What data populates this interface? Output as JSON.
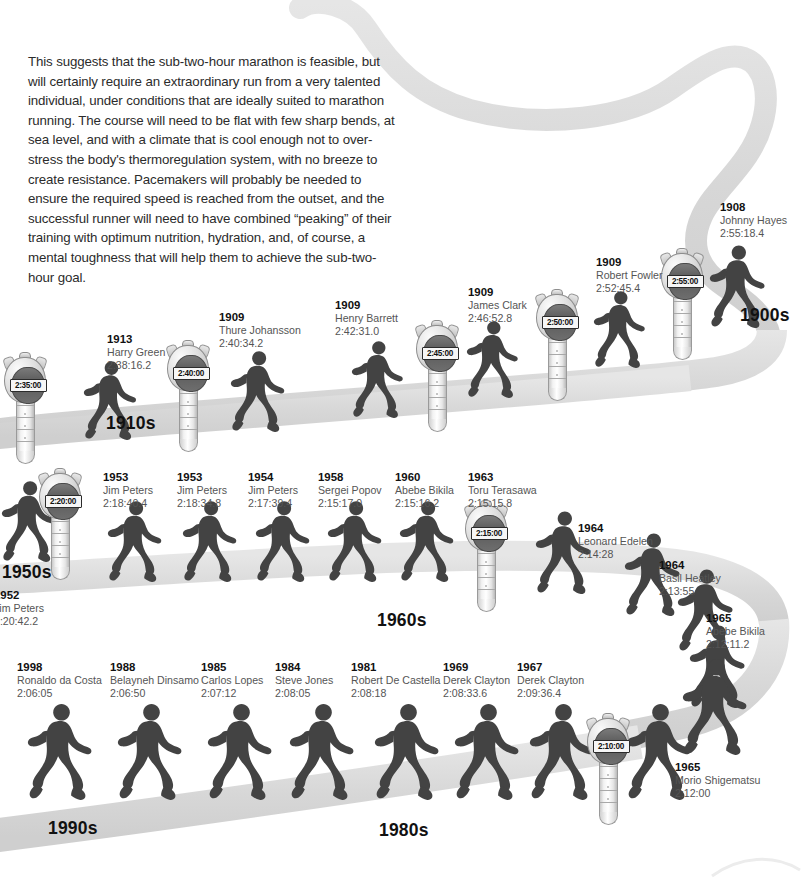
{
  "intro": {
    "paragraph": "This suggests that the sub-two-hour marathon is feasible, but will certainly require an extraordinary run from a very talented individual, under conditions that are ideally suited to marathon running. The course will need to be flat with few sharp bends, at sea level, and with a climate that is cool enough not to over-stress the body's thermoregulation system, with no breeze to create resistance. Pacemakers will probably be needed to ensure the required speed is reached from the outset, and the successful runner will need to have combined “peaking” of their training with optimum nutrition, hydration, and, of course, a mental toughness that will help them to achieve the sub-two-hour goal."
  },
  "colors": {
    "path": "#d8d8d8",
    "runner": "#4d4d4d",
    "label_year": "#111111",
    "label_text": "#555555",
    "lcd_bg": "#f6f6f6",
    "background": "#ffffff"
  },
  "decades": [
    {
      "label": "1900s",
      "x": 740,
      "y": 305
    },
    {
      "label": "1910s",
      "x": 106,
      "y": 413
    },
    {
      "label": "1950s",
      "x": 2,
      "y": 562
    },
    {
      "label": "1960s",
      "x": 377,
      "y": 610
    },
    {
      "label": "1990s",
      "x": 48,
      "y": 818
    },
    {
      "label": "1980s",
      "x": 379,
      "y": 820
    }
  ],
  "records": [
    {
      "year": "1908",
      "name": "Johnny Hayes",
      "time": "2:55:18.4",
      "x": 720,
      "y": 200,
      "align": "left"
    },
    {
      "year": "1909",
      "name": "Robert Fowler",
      "time": "2:52:45.4",
      "x": 596,
      "y": 255,
      "align": "left"
    },
    {
      "year": "1909",
      "name": "James Clark",
      "time": "2:46:52.8",
      "x": 468,
      "y": 285,
      "align": "left"
    },
    {
      "year": "1909",
      "name": "Henry Barrett",
      "time": "2:42:31.0",
      "x": 335,
      "y": 298,
      "align": "left"
    },
    {
      "year": "1909",
      "name": "Thure Johansson",
      "time": "2:40:34.2",
      "x": 219,
      "y": 310,
      "align": "left"
    },
    {
      "year": "1913",
      "name": "Harry Green",
      "time": "2:38:16.2",
      "x": 107,
      "y": 332,
      "align": "left"
    },
    {
      "year": "1952",
      "name": "Jim Peters",
      "time": "2:20:42.2",
      "x": -6,
      "y": 588,
      "align": "left"
    },
    {
      "year": "1953",
      "name": "Jim Peters",
      "time": "2:18:40.4",
      "x": 103,
      "y": 470,
      "align": "left"
    },
    {
      "year": "1953",
      "name": "Jim Peters",
      "time": "2:18:34.8",
      "x": 177,
      "y": 470,
      "align": "left"
    },
    {
      "year": "1954",
      "name": "Jim Peters",
      "time": "2:17:39.4",
      "x": 248,
      "y": 470,
      "align": "left"
    },
    {
      "year": "1958",
      "name": "Sergei Popov",
      "time": "2:15:17.0",
      "x": 318,
      "y": 470,
      "align": "left"
    },
    {
      "year": "1960",
      "name": "Abebe Bikila",
      "time": "2:15:16.2",
      "x": 395,
      "y": 470,
      "align": "left"
    },
    {
      "year": "1963",
      "name": "Toru Terasawa",
      "time": "2:15:15.8",
      "x": 468,
      "y": 470,
      "align": "left"
    },
    {
      "year": "1964",
      "name": "Leonard Edelen",
      "time": "2:14:28",
      "x": 578,
      "y": 521,
      "align": "left"
    },
    {
      "year": "1964",
      "name": "Basil Heatley",
      "time": "2:13:55",
      "x": 659,
      "y": 558,
      "align": "left"
    },
    {
      "year": "1965",
      "name": "Abebe Bikila",
      "time": "2:12:11.2",
      "x": 706,
      "y": 611,
      "align": "left"
    },
    {
      "year": "1965",
      "name": "Morio Shigematsu",
      "time": "2:12:00",
      "x": 675,
      "y": 760,
      "align": "left"
    },
    {
      "year": "1967",
      "name": "Derek Clayton",
      "time": "2:09:36.4",
      "x": 517,
      "y": 660,
      "align": "left"
    },
    {
      "year": "1969",
      "name": "Derek Clayton",
      "time": "2:08:33.6",
      "x": 443,
      "y": 660,
      "align": "left"
    },
    {
      "year": "1981",
      "name": "Robert De Castella",
      "time": "2:08:18",
      "x": 351,
      "y": 660,
      "align": "left"
    },
    {
      "year": "1984",
      "name": "Steve Jones",
      "time": "2:08:05",
      "x": 275,
      "y": 660,
      "align": "left"
    },
    {
      "year": "1985",
      "name": "Carlos Lopes",
      "time": "2:07:12",
      "x": 201,
      "y": 660,
      "align": "left"
    },
    {
      "year": "1988",
      "name": "Belayneh Dinsamo",
      "time": "2:06:50",
      "x": 110,
      "y": 660,
      "align": "left"
    },
    {
      "year": "1998",
      "name": "Ronaldo da Costa",
      "time": "2:06:05",
      "x": 17,
      "y": 660,
      "align": "left"
    }
  ],
  "stopwatches": [
    {
      "time": "2:55:00",
      "x": 659,
      "y": 248
    },
    {
      "time": "2:50:00",
      "x": 534,
      "y": 289
    },
    {
      "time": "2:45:00",
      "x": 414,
      "y": 320
    },
    {
      "time": "2:40:00",
      "x": 165,
      "y": 340
    },
    {
      "time": "2:35:00",
      "x": 2,
      "y": 352
    },
    {
      "time": "2:20:00",
      "x": 37,
      "y": 468
    },
    {
      "time": "2:15:00",
      "x": 463,
      "y": 500
    },
    {
      "time": "2:10:00",
      "x": 585,
      "y": 713
    }
  ],
  "runners": [
    {
      "x": 710,
      "y": 242,
      "h": 86,
      "flip": false,
      "shade": "dk"
    },
    {
      "x": 594,
      "y": 288,
      "h": 80,
      "flip": false,
      "shade": "dk"
    },
    {
      "x": 467,
      "y": 318,
      "h": 80,
      "flip": false,
      "shade": "dk"
    },
    {
      "x": 352,
      "y": 338,
      "h": 80,
      "flip": false,
      "shade": "dk"
    },
    {
      "x": 231,
      "y": 348,
      "h": 84,
      "flip": false,
      "shade": "dk"
    },
    {
      "x": 84,
      "y": 358,
      "h": 82,
      "flip": false,
      "shade": "dk"
    },
    {
      "x": 2,
      "y": 478,
      "h": 84,
      "flip": false,
      "shade": "dk"
    },
    {
      "x": 108,
      "y": 498,
      "h": 84,
      "flip": false,
      "shade": "dk"
    },
    {
      "x": 183,
      "y": 498,
      "h": 84,
      "flip": false,
      "shade": "dk"
    },
    {
      "x": 256,
      "y": 498,
      "h": 84,
      "flip": false,
      "shade": "dk"
    },
    {
      "x": 328,
      "y": 498,
      "h": 84,
      "flip": false,
      "shade": "dk"
    },
    {
      "x": 400,
      "y": 498,
      "h": 84,
      "flip": false,
      "shade": "dk"
    },
    {
      "x": 536,
      "y": 508,
      "h": 86,
      "flip": false,
      "shade": "dk"
    },
    {
      "x": 625,
      "y": 530,
      "h": 86,
      "flip": false,
      "shade": "dk"
    },
    {
      "x": 678,
      "y": 566,
      "h": 86,
      "flip": false,
      "shade": "dk"
    },
    {
      "x": 690,
      "y": 622,
      "h": 86,
      "flip": false,
      "shade": "dk"
    },
    {
      "x": 28,
      "y": 700,
      "h": 100,
      "flip": false,
      "shade": "dk"
    },
    {
      "x": 118,
      "y": 700,
      "h": 100,
      "flip": false,
      "shade": "dk"
    },
    {
      "x": 208,
      "y": 700,
      "h": 100,
      "flip": false,
      "shade": "dk"
    },
    {
      "x": 290,
      "y": 700,
      "h": 100,
      "flip": false,
      "shade": "dk"
    },
    {
      "x": 375,
      "y": 700,
      "h": 100,
      "flip": false,
      "shade": "dk"
    },
    {
      "x": 455,
      "y": 700,
      "h": 100,
      "flip": false,
      "shade": "dk"
    },
    {
      "x": 530,
      "y": 700,
      "h": 100,
      "flip": false,
      "shade": "dk"
    },
    {
      "x": 627,
      "y": 700,
      "h": 100,
      "flip": false,
      "shade": "dk"
    },
    {
      "x": 683,
      "y": 655,
      "h": 100,
      "flip": false,
      "shade": "dk"
    }
  ],
  "chart_data": {
    "type": "line",
    "xlabel": "Year",
    "ylabel": "Record time",
    "series": [
      {
        "name": "Men's marathon world record",
        "points": [
          {
            "year": 1908,
            "athlete": "Johnny Hayes",
            "time": "2:55:18.4"
          },
          {
            "year": 1909,
            "athlete": "Robert Fowler",
            "time": "2:52:45.4"
          },
          {
            "year": 1909,
            "athlete": "James Clark",
            "time": "2:46:52.8"
          },
          {
            "year": 1909,
            "athlete": "Henry Barrett",
            "time": "2:42:31.0"
          },
          {
            "year": 1909,
            "athlete": "Thure Johansson",
            "time": "2:40:34.2"
          },
          {
            "year": 1913,
            "athlete": "Harry Green",
            "time": "2:38:16.2"
          },
          {
            "year": 1952,
            "athlete": "Jim Peters",
            "time": "2:20:42.2"
          },
          {
            "year": 1953,
            "athlete": "Jim Peters",
            "time": "2:18:40.4"
          },
          {
            "year": 1953,
            "athlete": "Jim Peters",
            "time": "2:18:34.8"
          },
          {
            "year": 1954,
            "athlete": "Jim Peters",
            "time": "2:17:39.4"
          },
          {
            "year": 1958,
            "athlete": "Sergei Popov",
            "time": "2:15:17.0"
          },
          {
            "year": 1960,
            "athlete": "Abebe Bikila",
            "time": "2:15:16.2"
          },
          {
            "year": 1963,
            "athlete": "Toru Terasawa",
            "time": "2:15:15.8"
          },
          {
            "year": 1964,
            "athlete": "Leonard Edelen",
            "time": "2:14:28"
          },
          {
            "year": 1964,
            "athlete": "Basil Heatley",
            "time": "2:13:55"
          },
          {
            "year": 1965,
            "athlete": "Abebe Bikila",
            "time": "2:12:11.2"
          },
          {
            "year": 1965,
            "athlete": "Morio Shigematsu",
            "time": "2:12:00"
          },
          {
            "year": 1967,
            "athlete": "Derek Clayton",
            "time": "2:09:36.4"
          },
          {
            "year": 1969,
            "athlete": "Derek Clayton",
            "time": "2:08:33.6"
          },
          {
            "year": 1981,
            "athlete": "Robert De Castella",
            "time": "2:08:18"
          },
          {
            "year": 1984,
            "athlete": "Steve Jones",
            "time": "2:08:05"
          },
          {
            "year": 1985,
            "athlete": "Carlos Lopes",
            "time": "2:07:12"
          },
          {
            "year": 1988,
            "athlete": "Belayneh Dinsamo",
            "time": "2:06:50"
          },
          {
            "year": 1998,
            "athlete": "Ronaldo da Costa",
            "time": "2:06:05"
          }
        ]
      }
    ],
    "milestone_markers": [
      "2:55:00",
      "2:50:00",
      "2:45:00",
      "2:40:00",
      "2:35:00",
      "2:20:00",
      "2:15:00",
      "2:10:00"
    ],
    "decade_bands": [
      "1900s",
      "1910s",
      "1950s",
      "1960s",
      "1980s",
      "1990s"
    ]
  }
}
